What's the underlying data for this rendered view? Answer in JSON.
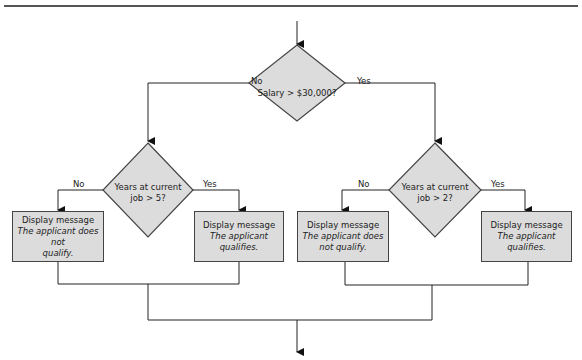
{
  "decisions": {
    "main": {
      "text": "Salary > $30,000?",
      "no_label": "No",
      "yes_label": "Yes"
    },
    "left": {
      "line1": "Years at current",
      "line2": "job > 5?",
      "no_label": "No",
      "yes_label": "Yes"
    },
    "right": {
      "line1": "Years at current",
      "line2": "job > 2?",
      "no_label": "No",
      "yes_label": "Yes"
    }
  },
  "processes": [
    {
      "title": "Display message",
      "line1": "The applicant does not",
      "line2": "qualify."
    },
    {
      "title": "Display message",
      "line1": "The applicant qualifies.",
      "line2": ""
    },
    {
      "title": "Display message",
      "line1": "The applicant does",
      "line2": "not qualify."
    },
    {
      "title": "Display message",
      "line1": "The applicant qualifies.",
      "line2": ""
    }
  ],
  "colors": {
    "shape_fill": "#dcdcdc",
    "line": "#333333",
    "rule": "#555555"
  }
}
